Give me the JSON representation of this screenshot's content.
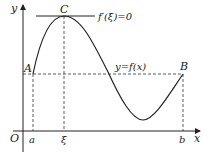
{
  "diagram": {
    "axes": {
      "x_label": "x",
      "y_label": "y",
      "origin_label": "O"
    },
    "points": {
      "A": "A",
      "B": "B",
      "C": "C"
    },
    "ticks": {
      "a": "a",
      "xi": "ξ",
      "b": "b"
    },
    "annotations": {
      "tangent": "f′(ξ)=0",
      "curve": "y=f(x)"
    },
    "colors": {
      "stroke": "#222222",
      "background": "#ffffff"
    }
  }
}
